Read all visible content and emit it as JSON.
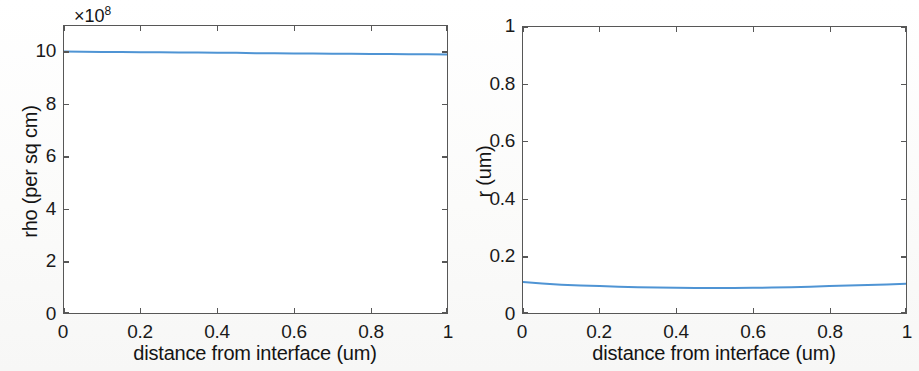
{
  "figure": {
    "background_color": "#fdfdfc",
    "axes_color": "#575757",
    "line_color": "#4f94d4",
    "text_color": "#141414"
  },
  "panels": [
    {
      "id": "left",
      "exponent_label": "×10",
      "exponent_power": "8",
      "xlabel": "distance from interface (um)",
      "ylabel": "rho (per sq cm)",
      "xticklabels": [
        "0",
        "0.2",
        "0.4",
        "0.6",
        "0.8",
        "1"
      ],
      "yticklabels": [
        "0",
        "2",
        "4",
        "6",
        "8",
        "10"
      ]
    },
    {
      "id": "right",
      "exponent_label": "",
      "exponent_power": "",
      "xlabel": "distance from interface (um)",
      "ylabel": "r (um)",
      "xticklabels": [
        "0",
        "0.2",
        "0.4",
        "0.6",
        "0.8",
        "1"
      ],
      "yticklabels": [
        "0",
        "0.2",
        "0.4",
        "0.6",
        "0.8",
        "1"
      ]
    }
  ],
  "chart_data": [
    {
      "type": "line",
      "title": "",
      "xlabel": "distance from interface (um)",
      "ylabel": "rho (per sq cm)",
      "y_exponent": 8,
      "y_multiplier_text": "×10^8",
      "xlim": [
        0,
        1
      ],
      "ylim": [
        0,
        11
      ],
      "xticks": [
        0,
        0.2,
        0.4,
        0.6,
        0.8,
        1
      ],
      "yticks": [
        0,
        2,
        4,
        6,
        8,
        10
      ],
      "grid": false,
      "legend": "none",
      "series": [
        {
          "name": "rho",
          "color": "#4f94d4",
          "x": [
            0,
            0.05,
            0.1,
            0.15,
            0.2,
            0.25,
            0.3,
            0.35,
            0.4,
            0.45,
            0.5,
            0.55,
            0.6,
            0.65,
            0.7,
            0.75,
            0.8,
            0.85,
            0.9,
            0.95,
            1
          ],
          "values": [
            10.02,
            10.01,
            10.0,
            10.0,
            9.99,
            9.99,
            9.98,
            9.98,
            9.97,
            9.97,
            9.96,
            9.96,
            9.95,
            9.95,
            9.94,
            9.94,
            9.93,
            9.93,
            9.92,
            9.92,
            9.91
          ]
        }
      ]
    },
    {
      "type": "line",
      "title": "",
      "xlabel": "distance from interface (um)",
      "ylabel": "r (um)",
      "xlim": [
        0,
        1
      ],
      "ylim": [
        0,
        1
      ],
      "xticks": [
        0,
        0.2,
        0.4,
        0.6,
        0.8,
        1
      ],
      "yticks": [
        0,
        0.2,
        0.4,
        0.6,
        0.8,
        1
      ],
      "grid": false,
      "legend": "none",
      "series": [
        {
          "name": "r",
          "color": "#4f94d4",
          "x": [
            0,
            0.05,
            0.1,
            0.15,
            0.2,
            0.25,
            0.3,
            0.35,
            0.4,
            0.45,
            0.5,
            0.55,
            0.6,
            0.65,
            0.7,
            0.75,
            0.8,
            0.85,
            0.9,
            0.95,
            1
          ],
          "values": [
            0.108,
            0.103,
            0.099,
            0.096,
            0.094,
            0.092,
            0.09,
            0.089,
            0.088,
            0.087,
            0.087,
            0.087,
            0.088,
            0.089,
            0.09,
            0.092,
            0.094,
            0.096,
            0.098,
            0.1,
            0.102
          ]
        }
      ]
    }
  ]
}
